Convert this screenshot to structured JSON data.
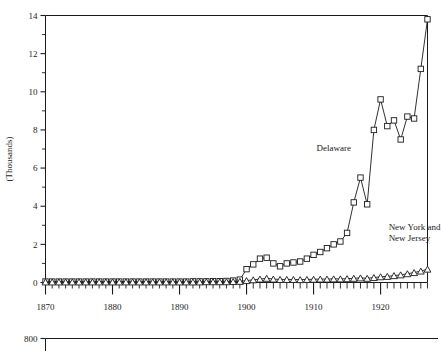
{
  "chart_data": {
    "type": "line",
    "title": "",
    "subtitle": "",
    "xlabel": "",
    "ylabel": "(Thousands)",
    "xlim": [
      1870,
      1927
    ],
    "ylim": [
      0,
      14
    ],
    "grid": false,
    "legend_position": "inline-annotation",
    "y_ticks": [
      0,
      2,
      4,
      6,
      8,
      10,
      12,
      14
    ],
    "y_tick_labels": [
      "0",
      "2",
      "4",
      "6",
      "8",
      "10",
      "12",
      "14"
    ],
    "y_minor_ticks": [
      1,
      3,
      5,
      7,
      9,
      11,
      13
    ],
    "x_ticks": [
      1870,
      1880,
      1890,
      1900,
      1910,
      1920
    ],
    "x_tick_labels": [
      "1870",
      "1880",
      "1890",
      "1900",
      "1910",
      "1920"
    ],
    "x_minor_tick_step": 1,
    "x": [
      1870,
      1871,
      1872,
      1873,
      1874,
      1875,
      1876,
      1877,
      1878,
      1879,
      1880,
      1881,
      1882,
      1883,
      1884,
      1885,
      1886,
      1887,
      1888,
      1889,
      1890,
      1891,
      1892,
      1893,
      1894,
      1895,
      1896,
      1897,
      1898,
      1899,
      1900,
      1901,
      1902,
      1903,
      1904,
      1905,
      1906,
      1907,
      1908,
      1909,
      1910,
      1911,
      1912,
      1913,
      1914,
      1915,
      1916,
      1917,
      1918,
      1919,
      1920,
      1921,
      1922,
      1923,
      1924,
      1925,
      1926,
      1927
    ],
    "series": [
      {
        "name": "Delaware",
        "marker": "square",
        "label_text": "Delaware",
        "values": [
          0.05,
          0.05,
          0.05,
          0.05,
          0.05,
          0.05,
          0.05,
          0.05,
          0.05,
          0.05,
          0.05,
          0.05,
          0.05,
          0.05,
          0.05,
          0.05,
          0.05,
          0.05,
          0.05,
          0.05,
          0.05,
          0.05,
          0.06,
          0.06,
          0.06,
          0.07,
          0.07,
          0.08,
          0.1,
          0.15,
          0.7,
          0.95,
          1.25,
          1.3,
          1.0,
          0.85,
          1.0,
          1.05,
          1.1,
          1.25,
          1.45,
          1.6,
          1.8,
          2.0,
          2.15,
          2.6,
          4.2,
          5.5,
          4.1,
          8.0,
          9.6,
          8.2,
          8.5,
          7.5,
          8.7,
          8.6,
          11.2,
          13.8
        ]
      },
      {
        "name": "New York and New Jersey",
        "marker": "triangle",
        "label_text": "New York and\nNew Jersey",
        "label_line1": "New York and",
        "label_line2": "New Jersey",
        "values": [
          0.03,
          0.03,
          0.03,
          0.03,
          0.03,
          0.03,
          0.03,
          0.03,
          0.03,
          0.03,
          0.03,
          0.03,
          0.03,
          0.03,
          0.03,
          0.03,
          0.03,
          0.03,
          0.03,
          0.03,
          0.03,
          0.03,
          0.03,
          0.03,
          0.04,
          0.04,
          0.04,
          0.04,
          0.05,
          0.06,
          0.1,
          0.14,
          0.18,
          0.22,
          0.18,
          0.16,
          0.16,
          0.16,
          0.15,
          0.16,
          0.17,
          0.18,
          0.18,
          0.19,
          0.19,
          0.2,
          0.22,
          0.24,
          0.22,
          0.26,
          0.3,
          0.32,
          0.36,
          0.4,
          0.46,
          0.52,
          0.6,
          0.7
        ]
      }
    ],
    "annotations": [
      {
        "name": "delaware-label",
        "text": "Delaware",
        "x": 1913,
        "y": 6.9
      },
      {
        "name": "ny-nj-label",
        "text": "New York and New Jersey",
        "x": 1921,
        "y": 2.4
      }
    ]
  },
  "secondary_chart": {
    "type": "line",
    "y_top_tick_label": "800",
    "note": "partially visible lower panel"
  }
}
